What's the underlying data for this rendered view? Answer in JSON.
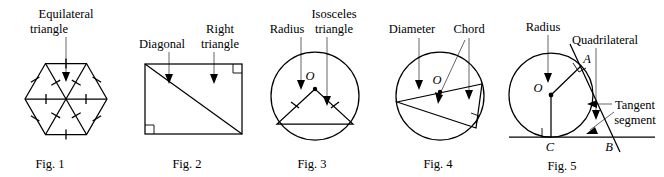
{
  "sheet": {
    "title": "Geometry figures plate",
    "background_color": "#ffffff",
    "ink_color": "#000000",
    "leader_color": "#555555"
  },
  "figures": [
    {
      "id": "fig1",
      "caption": "Fig. 1",
      "shape": "regular-hexagon-divided-into-six-triangles",
      "labels": [
        {
          "name": "equilateral-triangle-label",
          "line1": "Equilateral",
          "line2": "triangle",
          "pointer": "arrow-down"
        }
      ],
      "marks": {
        "congruence_ticks": 12,
        "description": "single tick on each hexagon side and each internal radius"
      }
    },
    {
      "id": "fig2",
      "caption": "Fig. 2",
      "shape": "rectangle-with-diagonal",
      "labels": [
        {
          "name": "diagonal-label",
          "line1": "Diagonal",
          "line2": "",
          "pointer": "arrow-down"
        },
        {
          "name": "right-triangle-label",
          "line1": "Right",
          "line2": "triangle",
          "pointer": "arrow-down"
        }
      ],
      "marks": {
        "right_angle_squares": 2,
        "description": "right-angle squares at top-right and bottom-left corners"
      }
    },
    {
      "id": "fig3",
      "caption": "Fig. 3",
      "shape": "circle-with-inscribed-isosceles-triangle",
      "center_label": "O",
      "labels": [
        {
          "name": "radius-label",
          "line1": "Radius",
          "line2": "",
          "pointer": "arrow-down"
        },
        {
          "name": "isosceles-triangle-label",
          "line1": "Isosceles",
          "line2": "triangle",
          "pointer": "arrow-down"
        }
      ],
      "marks": {
        "congruence_ticks": 2,
        "description": "tick marks on the two equal radii forming the triangle legs"
      }
    },
    {
      "id": "fig4",
      "caption": "Fig. 4",
      "shape": "circle-with-diameter-and-chord-right-triangle",
      "center_label": "O",
      "labels": [
        {
          "name": "diameter-label",
          "line1": "Diameter",
          "line2": "",
          "pointer": "arrow-down"
        },
        {
          "name": "chord-label",
          "line1": "Chord",
          "line2": "",
          "pointer": "arrow-down"
        }
      ],
      "marks": {
        "right_angle_squares": 1,
        "description": "right angle inscribed in the semicircle"
      }
    },
    {
      "id": "fig5",
      "caption": "Fig. 5",
      "shape": "circle-with-two-tangents-and-quadrilateral",
      "center_label": "O",
      "point_labels": [
        "A",
        "B",
        "C"
      ],
      "labels": [
        {
          "name": "radius-label",
          "line1": "Radius",
          "line2": "",
          "pointer": "arrow-down"
        },
        {
          "name": "quadrilateral-label",
          "line1": "Quadrilateral",
          "line2": "",
          "pointer": "arrow-down"
        },
        {
          "name": "tangent-segment-label",
          "line1": "Tangent",
          "line2": "segment",
          "pointer": "arrow-left"
        }
      ],
      "marks": {
        "right_angle_squares": 2,
        "description": "right angles where radii meet the tangent lines at A and C"
      }
    }
  ]
}
